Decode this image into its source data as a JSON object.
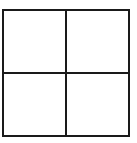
{
  "diagram": {
    "type": "grid",
    "rows": 2,
    "columns": 2,
    "cells": [
      {
        "row": 0,
        "col": 0,
        "label": ""
      },
      {
        "row": 0,
        "col": 1,
        "label": ""
      },
      {
        "row": 1,
        "col": 0,
        "label": ""
      },
      {
        "row": 1,
        "col": 1,
        "label": ""
      }
    ],
    "line_color": "#1a1a1a",
    "background": "#ffffff"
  }
}
